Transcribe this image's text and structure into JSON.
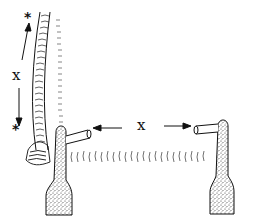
{
  "diagram": {
    "labels": {
      "vertical_distance": "x",
      "horizontal_distance": "x",
      "top_marker": "*",
      "bottom_marker": "*"
    },
    "colors": {
      "ink": "#111111",
      "background": "#ffffff",
      "stipple": "#555555"
    }
  }
}
